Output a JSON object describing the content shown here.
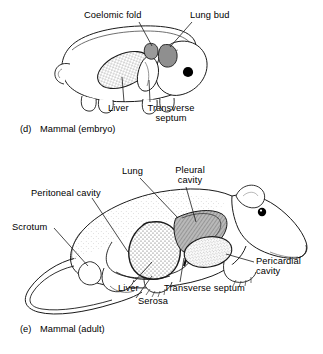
{
  "figure": {
    "background_color": "#ffffff",
    "ink_color": "#000000"
  },
  "panels": [
    {
      "id": "d",
      "caption_tag": "(d)",
      "caption_text": "Mammal (embryo)",
      "labels": [
        {
          "id": "coelomic-fold",
          "text": "Coelomic fold"
        },
        {
          "id": "lung-bud",
          "text": "Lung bud"
        },
        {
          "id": "liver",
          "text": "Liver"
        },
        {
          "id": "transverse-septum",
          "text": "Transverse septum"
        }
      ]
    },
    {
      "id": "e",
      "caption_tag": "(e)",
      "caption_text": "Mammal (adult)",
      "labels": [
        {
          "id": "lung",
          "text": "Lung"
        },
        {
          "id": "pleural-cavity",
          "text": "Pleural cavity"
        },
        {
          "id": "peritoneal-cavity",
          "text": "Peritoneal cavity"
        },
        {
          "id": "scrotum",
          "text": "Scrotum"
        },
        {
          "id": "pericardial-cavity",
          "text": "Pericardial cavity"
        },
        {
          "id": "liver",
          "text": "Liver"
        },
        {
          "id": "transverse-septum",
          "text": "Transverse septum"
        },
        {
          "id": "serosa",
          "text": "Serosa"
        }
      ]
    }
  ],
  "embryo": {
    "caption_tag": "(d)",
    "caption_text": "Mammal (embryo)",
    "coelomic_fold_label": "Coelomic fold",
    "lung_bud_label": "Lung bud",
    "liver_label": "Liver",
    "transverse_septum_label": "Transverse septum"
  },
  "adult": {
    "caption_tag": "(e)",
    "caption_text": "Mammal (adult)",
    "lung_label": "Lung",
    "pleural_cavity_label": "Pleural cavity",
    "peritoneal_cavity_label": "Peritoneal cavity",
    "scrotum_label": "Scrotum",
    "pericardial_cavity_label": "Pericardial cavity",
    "liver_label": "Liver",
    "transverse_septum_label": "Transverse septum",
    "serosa_label": "Serosa"
  }
}
